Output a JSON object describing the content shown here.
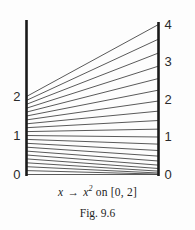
{
  "figure": {
    "caption_prefix": "x",
    "caption_arrow": "→",
    "caption_function_base": "x",
    "caption_function_exponent": "2",
    "caption_domain_text": "on [0, 2]",
    "figure_number": "Fig. 9.6"
  },
  "axes": {
    "left_axis_name": "domain-axis",
    "right_axis_name": "range-axis",
    "left_ticks": [
      {
        "label": "2",
        "value": 2
      },
      {
        "label": "1",
        "value": 1
      },
      {
        "label": "0",
        "value": 0
      }
    ],
    "right_ticks": [
      {
        "label": "4",
        "value": 4
      },
      {
        "label": "3",
        "value": 3
      },
      {
        "label": "2",
        "value": 2
      },
      {
        "label": "1",
        "value": 1
      },
      {
        "label": "0",
        "value": 0
      }
    ]
  },
  "chart_data": {
    "type": "line",
    "subtitle": "Fig. 9.6",
    "xlabel": "",
    "ylabel": "",
    "grid": false,
    "legend": "none",
    "left_axis": {
      "name": "domain",
      "range": [
        0,
        2
      ],
      "tick_values": [
        0,
        1,
        2
      ],
      "tick_labels": [
        "0",
        "1",
        "2"
      ]
    },
    "right_axis": {
      "name": "range",
      "range": [
        0,
        4
      ],
      "tick_values": [
        0,
        1,
        2,
        3,
        4
      ],
      "tick_labels": [
        "0",
        "1",
        "2",
        "3",
        "4"
      ]
    },
    "series": [
      {
        "name": "x -> x^2 mapping segments",
        "x": [
          0,
          0.1,
          0.2,
          0.3,
          0.4,
          0.5,
          0.6,
          0.7,
          0.8,
          0.9,
          1.0,
          1.1,
          1.2,
          1.3,
          1.4,
          1.5,
          1.6,
          1.7,
          1.8,
          1.9,
          2.0
        ],
        "values": [
          0,
          0.01,
          0.04,
          0.09,
          0.16,
          0.25,
          0.36,
          0.49,
          0.64,
          0.81,
          1.0,
          1.21,
          1.44,
          1.69,
          1.96,
          2.25,
          2.56,
          2.89,
          3.24,
          3.61,
          4.0
        ]
      }
    ],
    "segment_count": 21
  }
}
